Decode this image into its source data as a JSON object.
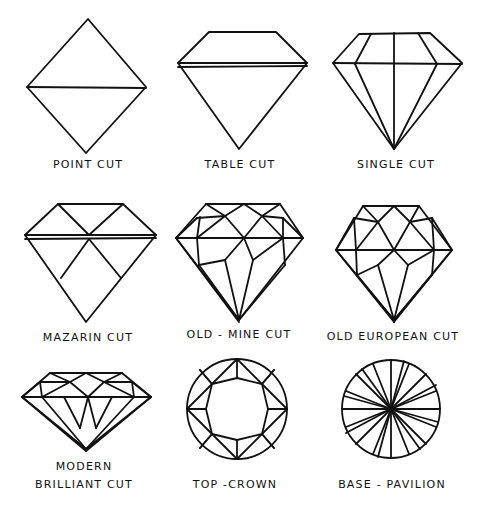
{
  "background": "#ffffff",
  "stroke_color": "#111111",
  "cuts": [
    {
      "id": "point",
      "label": "POINT CUT",
      "label_x": 88,
      "label_y": 158
    },
    {
      "id": "table",
      "label": "TABLE CUT",
      "label_x": 240,
      "label_y": 158
    },
    {
      "id": "single",
      "label": "SINGLE CUT",
      "label_x": 396,
      "label_y": 158
    },
    {
      "id": "mazarin",
      "label": "MAZARIN CUT",
      "label_x": 88,
      "label_y": 331
    },
    {
      "id": "old-mine",
      "label": "OLD - MINE CUT",
      "label_x": 239,
      "label_y": 328
    },
    {
      "id": "old-european",
      "label": "OLD EUROPEAN CUT",
      "label_x": 393,
      "label_y": 330
    },
    {
      "id": "modern-brilliant",
      "label_line1": "MODERN",
      "label_line2": "BRILLIANT CUT",
      "label_x": 86,
      "label_y": 460
    },
    {
      "id": "top-crown",
      "label": "TOP -CROWN",
      "label_x": 235,
      "label_y": 478
    },
    {
      "id": "base-pavilion",
      "label": "BASE - PAVILION",
      "label_x": 392,
      "label_y": 478
    }
  ]
}
